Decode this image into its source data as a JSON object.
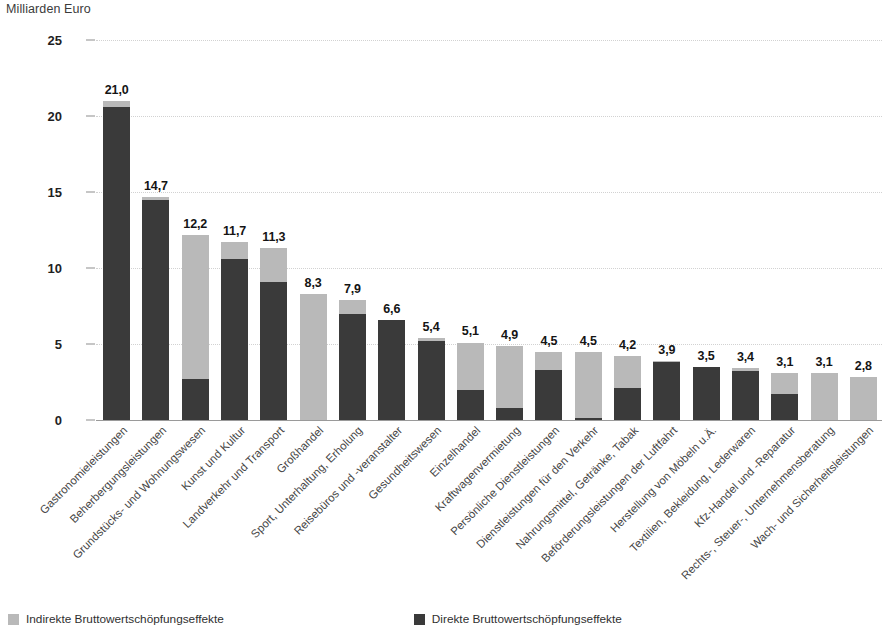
{
  "axis_unit_label": "Milliarden Euro",
  "colors": {
    "direct": "#3a3a3a",
    "indirect": "#b9b9b9",
    "grid": "#d2d2d2",
    "axis": "#9a9a9a",
    "text": "#2b2b2b"
  },
  "legend": {
    "items": [
      {
        "label": "Indirekte Bruttowertschöpfungseffekte",
        "color": "#b9b9b9",
        "key": "indirect"
      },
      {
        "label": "Direkte Bruttowertschöpfungseffekte",
        "color": "#3a3a3a",
        "key": "direct"
      }
    ]
  },
  "chart_data": {
    "type": "bar",
    "subtype": "stacked-column",
    "title": "",
    "subtitle": "",
    "xlabel": "",
    "ylabel": "Milliarden Euro",
    "ylim": [
      0,
      25
    ],
    "yticks": [
      0,
      5,
      10,
      15,
      20,
      25
    ],
    "ytick_labels": [
      "0",
      "5",
      "10",
      "15",
      "20",
      "25"
    ],
    "grid": true,
    "grid_axis": "y",
    "legend_position": "bottom-left",
    "value_label_format": "comma-decimal-one",
    "categories": [
      "Gastronomieleistungen",
      "Beherbergungsleistungen",
      "Grundstücks- und Wohnungswesen",
      "Kunst und Kultur",
      "Landverkehr und Transport",
      "Großhandel",
      "Sport, Unterhaltung, Erholung",
      "Reisebüros und -veranstalter",
      "Gesundheitswesen",
      "Einzelhandel",
      "Kraftwagenvermietung",
      "Persönliche Dienstleistungen",
      "Dienstleistungen für den Verkehr",
      "Nahrungsmittel, Getränke, Tabak",
      "Beförderungsleistungen der Luftfahrt",
      "Herstellung von Möbeln u.Ä.",
      "Textilien, Bekleidung, Lederwaren",
      "Kfz-Handel und -Reparatur",
      "Rechts-, Steuer-, Unternehmensberatung",
      "Wach- und Sicherheitsleistungen"
    ],
    "series": [
      {
        "name": "Direkte Bruttowertschöpfungseffekte",
        "key": "direct",
        "color": "#3a3a3a",
        "values": [
          20.6,
          14.5,
          2.7,
          10.6,
          9.1,
          0.0,
          7.0,
          6.6,
          5.2,
          2.0,
          0.8,
          3.3,
          0.15,
          2.1,
          3.8,
          3.5,
          3.2,
          1.7,
          0.0,
          0.0
        ]
      },
      {
        "name": "Indirekte Bruttowertschöpfungseffekte",
        "key": "indirect",
        "color": "#b9b9b9",
        "values": [
          0.4,
          0.2,
          9.5,
          1.1,
          2.2,
          8.3,
          0.9,
          0.0,
          0.2,
          3.1,
          4.1,
          1.2,
          4.35,
          2.1,
          0.1,
          0.0,
          0.2,
          1.4,
          3.1,
          2.8
        ]
      }
    ],
    "totals": [
      21.0,
      14.7,
      12.2,
      11.7,
      11.3,
      8.3,
      7.9,
      6.6,
      5.4,
      5.1,
      4.9,
      4.5,
      4.5,
      4.2,
      3.9,
      3.5,
      3.4,
      3.1,
      3.1,
      2.8
    ],
    "total_labels": [
      "21,0",
      "14,7",
      "12,2",
      "11,7",
      "11,3",
      "8,3",
      "7,9",
      "6,6",
      "5,4",
      "5,1",
      "4,9",
      "4,5",
      "4,5",
      "4,2",
      "3,9",
      "3,5",
      "3,4",
      "3,1",
      "3,1",
      "2,8"
    ]
  }
}
